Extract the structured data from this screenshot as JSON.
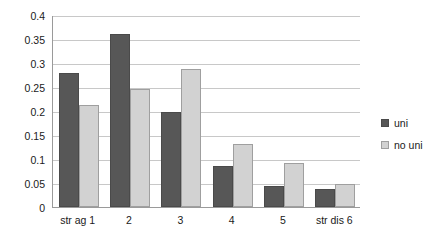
{
  "chart_data": {
    "type": "bar",
    "title": "",
    "subtitle": "",
    "xlabel": "",
    "ylabel": "",
    "ylim": [
      0,
      0.4
    ],
    "ytick_values": [
      0,
      0.05,
      0.1,
      0.15,
      0.2,
      0.25,
      0.3,
      0.35,
      0.4
    ],
    "ytick_labels": [
      "0",
      "0.05",
      "0.1",
      "0.15",
      "0.2",
      "0.25",
      "0.3",
      "0.35",
      "0.4"
    ],
    "grid": true,
    "legend_position": "right",
    "categories": [
      "str ag 1",
      "2",
      "3",
      "4",
      "5",
      "str dis 6"
    ],
    "series": [
      {
        "name": "uni",
        "color": "#575757",
        "values": [
          0.28,
          0.36,
          0.197,
          0.085,
          0.044,
          0.037
        ]
      },
      {
        "name": "no uni",
        "color": "#d2d2d2",
        "values": [
          0.213,
          0.246,
          0.287,
          0.132,
          0.091,
          0.048
        ]
      }
    ]
  },
  "legend": {
    "items": [
      {
        "label": "uni"
      },
      {
        "label": "no uni"
      }
    ]
  },
  "colors": {
    "series_uni": "#575757",
    "series_nouni": "#d2d2d2",
    "gridline": "#c8c8c8",
    "axis": "#9a9a9a",
    "text": "#1a1a1a",
    "background": "#ffffff"
  }
}
